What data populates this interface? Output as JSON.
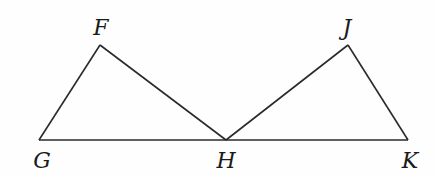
{
  "diagram": {
    "title": "",
    "points": [
      {
        "id": "F",
        "label": "F",
        "x": 100,
        "y": 45,
        "lx": 101,
        "ly": 35
      },
      {
        "id": "G",
        "label": "G",
        "x": 39,
        "y": 140,
        "lx": 42,
        "ly": 168
      },
      {
        "id": "H",
        "label": "H",
        "x": 226,
        "y": 140,
        "lx": 226,
        "ly": 168
      },
      {
        "id": "J",
        "label": "J",
        "x": 348,
        "y": 45,
        "lx": 347,
        "ly": 35
      },
      {
        "id": "K",
        "label": "K",
        "x": 408,
        "y": 140,
        "lx": 410,
        "ly": 168
      }
    ],
    "segments": [
      [
        "G",
        "F"
      ],
      [
        "F",
        "H"
      ],
      [
        "G",
        "H"
      ],
      [
        "H",
        "J"
      ],
      [
        "J",
        "K"
      ],
      [
        "H",
        "K"
      ]
    ],
    "triangles": [
      "FGH",
      "JHK"
    ],
    "stroke_color": "#2a2a2a",
    "label_color": "#1a1a1a"
  }
}
